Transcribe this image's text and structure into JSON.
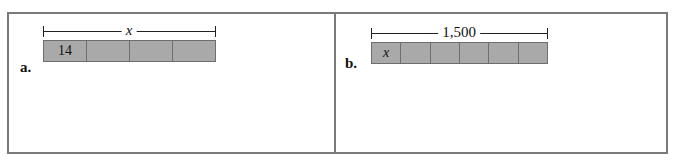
{
  "panels": [
    {
      "label": "a.",
      "bracket_label": "x",
      "bracket_italic": true,
      "cells": [
        "14",
        "",
        "",
        ""
      ],
      "first_cell_italic": false
    },
    {
      "label": "b.",
      "bracket_label": "1,500",
      "bracket_italic": false,
      "cells": [
        "x",
        "",
        "",
        "",
        "",
        ""
      ],
      "first_cell_italic": true
    }
  ],
  "colors": {
    "bar_fill": "#a9a9a9",
    "bar_border": "#6e6e6e",
    "frame": "#7a7a7a"
  }
}
